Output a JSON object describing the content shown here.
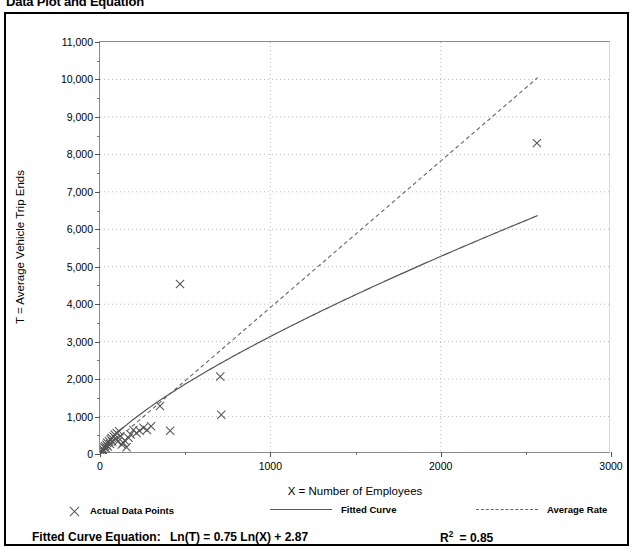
{
  "page_title": "Data Plot and Equation",
  "chart_data": {
    "type": "scatter",
    "title": "Data Plot and Equation",
    "xlabel": "X = Number of Employees",
    "ylabel": "T = Average Vehicle Trip Ends",
    "xlim": [
      0,
      3000
    ],
    "ylim": [
      0,
      11000
    ],
    "x_ticks": [
      0,
      1000,
      2000,
      3000
    ],
    "x_tick_labels": [
      "0",
      "1000",
      "2000",
      "3000"
    ],
    "x_minor_step": 500,
    "y_ticks": [
      0,
      1000,
      2000,
      3000,
      4000,
      5000,
      6000,
      7000,
      8000,
      9000,
      10000,
      11000
    ],
    "y_tick_labels": [
      "0",
      "1,000",
      "2,000",
      "3,000",
      "4,000",
      "5,000",
      "6,000",
      "7,000",
      "8,000",
      "9,000",
      "10,000",
      "11,000"
    ],
    "y_minor_step": 500,
    "grid": "dotted",
    "legend_position": "below-plot",
    "series": [
      {
        "name": "Actual Data Points",
        "type": "scatter",
        "marker": "x",
        "color": "#555555",
        "points": [
          [
            10,
            60
          ],
          [
            14,
            95
          ],
          [
            18,
            130
          ],
          [
            22,
            75
          ],
          [
            26,
            170
          ],
          [
            30,
            210
          ],
          [
            34,
            150
          ],
          [
            38,
            250
          ],
          [
            42,
            300
          ],
          [
            46,
            200
          ],
          [
            52,
            340
          ],
          [
            58,
            270
          ],
          [
            62,
            390
          ],
          [
            68,
            430
          ],
          [
            72,
            330
          ],
          [
            80,
            470
          ],
          [
            86,
            520
          ],
          [
            92,
            410
          ],
          [
            98,
            560
          ],
          [
            104,
            330
          ],
          [
            112,
            610
          ],
          [
            120,
            480
          ],
          [
            128,
            250
          ],
          [
            136,
            300
          ],
          [
            145,
            360
          ],
          [
            156,
            180
          ],
          [
            168,
            430
          ],
          [
            180,
            520
          ],
          [
            196,
            640
          ],
          [
            214,
            560
          ],
          [
            232,
            620
          ],
          [
            255,
            700
          ],
          [
            276,
            640
          ],
          [
            300,
            740
          ],
          [
            352,
            1280
          ],
          [
            412,
            620
          ],
          [
            470,
            4540
          ],
          [
            706,
            2070
          ],
          [
            712,
            1050
          ],
          [
            2565,
            8300
          ]
        ]
      },
      {
        "name": "Fitted Curve",
        "type": "line",
        "style": "solid",
        "color": "#555555",
        "equation": "Ln(T) = 0.75 Ln(X) + 2.87",
        "slope": 0.75,
        "intercept": 2.87,
        "x_range": [
          8,
          2570
        ]
      },
      {
        "name": "Average Rate",
        "type": "line",
        "style": "dashed",
        "color": "#666666",
        "rate": 3.91,
        "x_range": [
          0,
          2570
        ],
        "endpoint": [
          2570,
          10050
        ]
      }
    ],
    "annotations": {
      "equation_label": "Fitted Curve Equation:",
      "equation_value": "Ln(T) = 0.75 Ln(X) + 2.87",
      "r_squared_label": "R",
      "r_squared_exponent": "2",
      "r_squared_value": "= 0.85"
    }
  },
  "legend": {
    "items": [
      {
        "label": "Actual Data Points",
        "marker": "x-marker-icon"
      },
      {
        "label": "Fitted Curve",
        "marker": "solid-line-icon"
      },
      {
        "label": "Average Rate",
        "marker": "dashed-line-icon"
      }
    ]
  }
}
